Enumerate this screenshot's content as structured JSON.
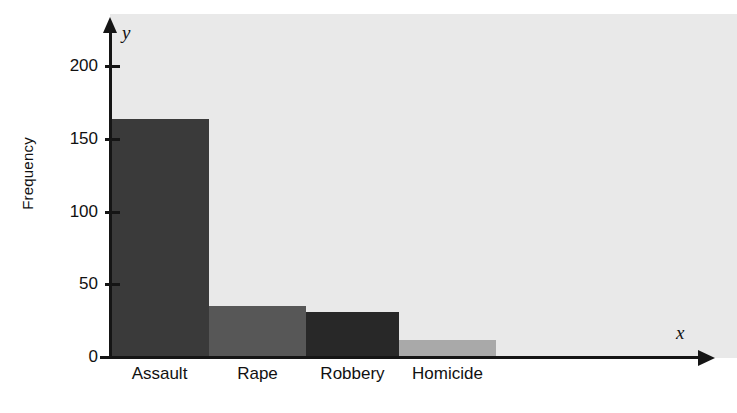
{
  "chart_data": {
    "type": "bar",
    "title": "",
    "subtitle": "",
    "xlabel": "",
    "ylabel": "Frequency",
    "x_axis_letter": "x",
    "y_axis_letter": "y",
    "categories": [
      "Assault",
      "Rape",
      "Robbery",
      "Homicide"
    ],
    "values": [
      164,
      35,
      31,
      12
    ],
    "ylim": [
      0,
      230
    ],
    "yticks": [
      0,
      50,
      100,
      150,
      200
    ],
    "ytick_labels": [
      "0",
      "50",
      "100",
      "150",
      "200"
    ],
    "grid": false,
    "legend": null,
    "bar_colors": [
      "#3a3a3a",
      "#575757",
      "#282828",
      "#a9a9a9"
    ],
    "plot_background": "#e9e9e9",
    "page_background": "#ffffff",
    "axis_color": "#151515",
    "bars_adjacent": true,
    "annotations": []
  }
}
